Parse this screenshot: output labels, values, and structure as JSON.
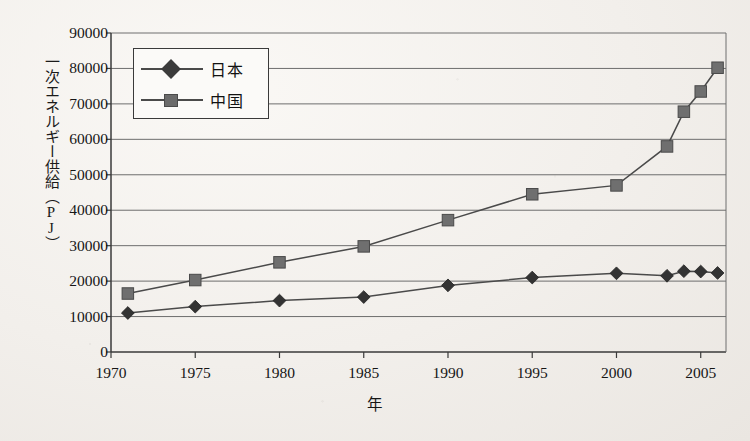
{
  "chart_data": {
    "type": "line",
    "title": "",
    "xlabel": "年",
    "ylabel": "一次エネルギー供給（PJ）",
    "xlim": [
      1970,
      2006.5
    ],
    "ylim": [
      0,
      90000
    ],
    "grid": true,
    "legend_position": "top-left",
    "x_ticks": [
      "1970",
      "1975",
      "1980",
      "1985",
      "1990",
      "1995",
      "2000",
      "2005"
    ],
    "x_tick_values": [
      1970,
      1975,
      1980,
      1985,
      1990,
      1995,
      2000,
      2005
    ],
    "y_ticks": [
      "0",
      "10000",
      "20000",
      "30000",
      "40000",
      "50000",
      "60000",
      "70000",
      "80000",
      "90000"
    ],
    "y_tick_values": [
      0,
      10000,
      20000,
      30000,
      40000,
      50000,
      60000,
      70000,
      80000,
      90000
    ],
    "series": [
      {
        "name": "日本",
        "marker": "diamond",
        "color": "#3b3b3b",
        "x": [
          1971,
          1975,
          1980,
          1985,
          1990,
          1995,
          2000,
          2003,
          2004,
          2005,
          2006
        ],
        "values": [
          11000,
          12800,
          14500,
          15500,
          18800,
          21000,
          22200,
          21500,
          22800,
          22700,
          22300
        ]
      },
      {
        "name": "中国",
        "marker": "square",
        "color": "#6b6b6b",
        "x": [
          1971,
          1975,
          1980,
          1985,
          1990,
          1995,
          2000,
          2003,
          2004,
          2005,
          2006
        ],
        "values": [
          16500,
          20300,
          25300,
          29800,
          37200,
          44500,
          47000,
          58000,
          67800,
          73500,
          80200
        ]
      }
    ]
  },
  "axis": {
    "y_label": "一次エネルギー供給（PJ）",
    "x_label": "年"
  },
  "legend": {
    "items": [
      {
        "label": "日本",
        "marker": "diamond-marker"
      },
      {
        "label": "中国",
        "marker": "square-marker"
      }
    ]
  }
}
